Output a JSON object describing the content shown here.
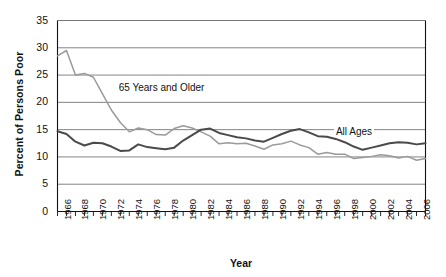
{
  "chart_data": {
    "type": "line",
    "title": "",
    "xlabel": "Year",
    "ylabel": "Percent of Persons Poor",
    "xlim": [
      1966,
      2007
    ],
    "ylim": [
      0,
      35
    ],
    "grid": "horizontal",
    "legend_position": "inline-annotation",
    "x": [
      1966,
      1967,
      1968,
      1969,
      1970,
      1971,
      1972,
      1973,
      1974,
      1975,
      1976,
      1977,
      1978,
      1979,
      1980,
      1981,
      1982,
      1983,
      1984,
      1985,
      1986,
      1987,
      1988,
      1989,
      1990,
      1991,
      1992,
      1993,
      1994,
      1995,
      1996,
      1997,
      1998,
      1999,
      2000,
      2001,
      2002,
      2003,
      2004,
      2005,
      2006,
      2007
    ],
    "xticklabels": [
      "1966",
      "1968",
      "1970",
      "1972",
      "1974",
      "1976",
      "1978",
      "1980",
      "1982",
      "1984",
      "1986",
      "1988",
      "1990",
      "1992",
      "1994",
      "1996",
      "1998",
      "2000",
      "2002",
      "2004",
      "2006"
    ],
    "yticklabels": [
      "0",
      "5",
      "10",
      "15",
      "20",
      "25",
      "30",
      "35"
    ],
    "yticks": [
      0,
      5,
      10,
      15,
      20,
      25,
      30,
      35
    ],
    "series": [
      {
        "name": "65 Years and Older",
        "color": "#9a9a9a",
        "label_x": 1972.6,
        "label_y": 22.4,
        "values": [
          28.5,
          29.5,
          25.0,
          25.3,
          24.6,
          21.6,
          18.6,
          16.3,
          14.6,
          15.3,
          15.0,
          14.1,
          14.0,
          15.2,
          15.7,
          15.3,
          14.6,
          13.8,
          12.4,
          12.6,
          12.4,
          12.5,
          12.0,
          11.4,
          12.2,
          12.4,
          12.9,
          12.2,
          11.7,
          10.5,
          10.8,
          10.5,
          10.5,
          9.7,
          9.9,
          10.1,
          10.4,
          10.2,
          9.8,
          10.1,
          9.4,
          9.7
        ]
      },
      {
        "name": "All Ages",
        "color": "#4a4a4a",
        "label_x": 1996.8,
        "label_y": 14.4,
        "values": [
          14.7,
          14.2,
          12.8,
          12.1,
          12.6,
          12.5,
          11.9,
          11.1,
          11.2,
          12.3,
          11.8,
          11.6,
          11.4,
          11.7,
          13.0,
          14.0,
          15.0,
          15.2,
          14.4,
          14.0,
          13.6,
          13.4,
          13.0,
          12.8,
          13.5,
          14.2,
          14.8,
          15.1,
          14.5,
          13.8,
          13.7,
          13.3,
          12.7,
          11.9,
          11.3,
          11.7,
          12.1,
          12.5,
          12.7,
          12.6,
          12.3,
          12.5
        ]
      }
    ]
  }
}
